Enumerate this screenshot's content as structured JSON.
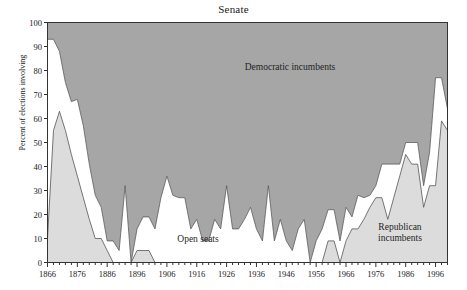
{
  "title": "Senate",
  "axes": {
    "ylabel": "Percent of elections involving",
    "y_ticks": [
      "0",
      "10",
      "20",
      "30",
      "40",
      "50",
      "60",
      "70",
      "80",
      "90",
      "100"
    ],
    "x_ticks": [
      "1866",
      "1876",
      "1886",
      "1896",
      "1906",
      "1916",
      "1926",
      "1936",
      "1946",
      "1956",
      "1966",
      "1976",
      "1986",
      "1996"
    ]
  },
  "annotations": {
    "democratic": "Democratic incumbents",
    "open": "Open seats",
    "republican_line1": "Republican",
    "republican_line2": "incumbents"
  },
  "colors": {
    "democratic": "#a6a6a6",
    "open": "#ffffff",
    "republican": "#dcdcdc",
    "outline": "#555555",
    "axis": "#333333",
    "text": "#1a1a1a"
  },
  "chart_data": {
    "type": "area",
    "stacked": true,
    "title": "Senate",
    "xlabel": "",
    "ylabel": "Percent of elections involving",
    "xlim": [
      1866,
      2000
    ],
    "ylim": [
      0,
      100
    ],
    "grid": false,
    "legend": "in-plot annotations",
    "x": [
      1866,
      1868,
      1870,
      1872,
      1874,
      1876,
      1878,
      1880,
      1882,
      1884,
      1886,
      1888,
      1890,
      1892,
      1894,
      1896,
      1898,
      1900,
      1902,
      1904,
      1906,
      1908,
      1910,
      1912,
      1914,
      1916,
      1918,
      1920,
      1922,
      1924,
      1926,
      1928,
      1930,
      1932,
      1934,
      1936,
      1938,
      1940,
      1942,
      1944,
      1946,
      1948,
      1950,
      1952,
      1954,
      1956,
      1958,
      1960,
      1962,
      1964,
      1966,
      1968,
      1970,
      1972,
      1974,
      1976,
      1978,
      1980,
      1982,
      1984,
      1986,
      1988,
      1990,
      1992,
      1994,
      1996,
      1998,
      2000
    ],
    "series": [
      {
        "name": "Republican incumbents",
        "values": [
          10,
          55,
          63,
          55,
          45,
          36,
          27,
          18,
          10,
          10,
          5,
          0,
          0,
          0,
          0,
          5,
          5,
          5,
          0,
          0,
          0,
          0,
          0,
          0,
          0,
          0,
          0,
          0,
          0,
          0,
          0,
          0,
          0,
          0,
          0,
          0,
          0,
          0,
          0,
          0,
          0,
          0,
          0,
          0,
          0,
          0,
          0,
          9,
          9,
          0,
          9,
          14,
          14,
          18,
          23,
          27,
          27,
          18,
          27,
          36,
          45,
          41,
          41,
          23,
          32,
          32,
          59,
          55
        ]
      },
      {
        "name": "Open seats",
        "values": [
          83,
          38,
          25,
          20,
          22,
          32,
          30,
          23,
          18,
          13,
          4,
          9,
          5,
          32,
          0,
          9,
          14,
          14,
          14,
          27,
          36,
          28,
          27,
          27,
          14,
          18,
          9,
          9,
          18,
          14,
          32,
          14,
          14,
          18,
          23,
          14,
          9,
          32,
          9,
          18,
          9,
          5,
          14,
          18,
          0,
          9,
          14,
          13,
          13,
          9,
          14,
          5,
          14,
          9,
          5,
          5,
          14,
          23,
          14,
          5,
          5,
          9,
          9,
          9,
          14,
          45,
          18,
          9
        ]
      },
      {
        "name": "Democratic incumbents",
        "values": [
          7,
          7,
          12,
          25,
          33,
          32,
          43,
          59,
          72,
          77,
          91,
          91,
          95,
          68,
          100,
          86,
          81,
          81,
          86,
          73,
          64,
          72,
          73,
          73,
          86,
          82,
          91,
          91,
          82,
          86,
          68,
          86,
          86,
          82,
          77,
          86,
          91,
          68,
          91,
          82,
          91,
          95,
          86,
          82,
          100,
          91,
          86,
          78,
          78,
          91,
          77,
          81,
          72,
          73,
          72,
          68,
          59,
          59,
          59,
          59,
          50,
          50,
          50,
          68,
          54,
          23,
          23,
          36
        ]
      }
    ]
  }
}
